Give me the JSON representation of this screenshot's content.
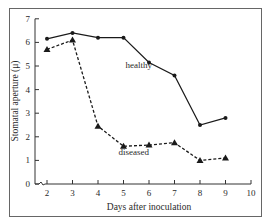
{
  "chart_data": {
    "type": "line",
    "title": "",
    "xlabel": "Days after inoculation",
    "ylabel": "Stomatal aperture (μ)",
    "x": [
      2,
      3,
      4,
      5,
      6,
      7,
      8,
      9
    ],
    "xticks": [
      2,
      3,
      4,
      5,
      6,
      7,
      8,
      9,
      10
    ],
    "yticks": [
      0,
      1,
      2,
      3,
      4,
      5,
      6,
      7
    ],
    "xlim": [
      1.5,
      10
    ],
    "ylim": [
      0,
      7
    ],
    "grid": false,
    "legend": "inline labels",
    "series": [
      {
        "name": "healthy",
        "style": "solid",
        "marker": "circle",
        "values": [
          6.15,
          6.4,
          6.2,
          6.2,
          5.15,
          4.6,
          2.5,
          2.8
        ],
        "label_pos": {
          "x": 5.6,
          "y": 4.9
        }
      },
      {
        "name": "diseased",
        "style": "dashed",
        "marker": "triangle",
        "values": [
          5.7,
          6.1,
          2.45,
          1.6,
          1.65,
          1.75,
          1.0,
          1.1
        ],
        "label_pos": {
          "x": 5.4,
          "y": 1.25
        }
      }
    ]
  },
  "colors": {
    "line": "#1a1a1a",
    "axis": "#333333",
    "frame": "#555555",
    "text": "#2a2a2a"
  }
}
